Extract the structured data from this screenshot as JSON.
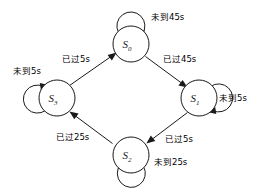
{
  "diagram": {
    "type": "state-transition-diagram",
    "title": "",
    "states": [
      {
        "id": "S0",
        "base": "S",
        "sub": "0",
        "cx": 131,
        "cy": 44,
        "r": 18,
        "self_loop": {
          "label": "未到45s",
          "position": "top"
        }
      },
      {
        "id": "S1",
        "base": "S",
        "sub": "1",
        "cx": 199,
        "cy": 98,
        "r": 18,
        "self_loop": {
          "label": "未到5s",
          "position": "right"
        }
      },
      {
        "id": "S2",
        "base": "S",
        "sub": "2",
        "cx": 131,
        "cy": 155,
        "r": 18,
        "self_loop": {
          "label": "未到25s",
          "position": "bottom"
        }
      },
      {
        "id": "S3",
        "base": "S",
        "sub": "3",
        "cx": 57,
        "cy": 98,
        "r": 18,
        "self_loop": {
          "label": "未到5s",
          "position": "left"
        }
      }
    ],
    "transitions": [
      {
        "from": "S3",
        "to": "S0",
        "label": "已过5s"
      },
      {
        "from": "S0",
        "to": "S1",
        "label": "已过45s"
      },
      {
        "from": "S1",
        "to": "S2",
        "label": "已过5s"
      },
      {
        "from": "S2",
        "to": "S3",
        "label": "已过25s"
      }
    ],
    "colors": {
      "stroke": "#1a1a1a",
      "node_fill": "#ffffff",
      "background": "#ffffff"
    }
  }
}
